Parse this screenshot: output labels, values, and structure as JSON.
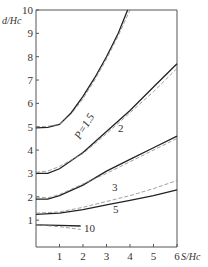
{
  "chart_data": {
    "type": "line",
    "title": "",
    "xlabel": "S/H_c",
    "ylabel": "d/H_c",
    "xlim": [
      0,
      6
    ],
    "ylim": [
      0,
      10
    ],
    "x_ticks": [
      "1",
      "2",
      "3",
      "4",
      "5",
      "6"
    ],
    "y_ticks": [
      "1",
      "2",
      "3",
      "4",
      "5",
      "6",
      "7",
      "8",
      "9",
      "10"
    ],
    "grid": false,
    "legend": "inline curve labels",
    "series": [
      {
        "name": "P=1.5",
        "style": "solid",
        "points": [
          [
            0,
            4.95
          ],
          [
            0.5,
            4.97
          ],
          [
            1,
            5.1
          ],
          [
            1.5,
            5.6
          ],
          [
            2,
            6.3
          ],
          [
            2.5,
            7.1
          ],
          [
            3,
            8.0
          ],
          [
            3.5,
            9.0
          ],
          [
            3.9,
            10.0
          ]
        ]
      },
      {
        "name": "P=1.5 (dashed)",
        "style": "dashed",
        "points": [
          [
            0,
            5.0
          ],
          [
            0.5,
            5.02
          ],
          [
            1,
            5.1
          ],
          [
            1.5,
            5.55
          ],
          [
            2,
            6.2
          ],
          [
            2.5,
            7.0
          ],
          [
            3,
            7.9
          ],
          [
            3.5,
            8.9
          ],
          [
            4.0,
            10.0
          ]
        ]
      },
      {
        "name": "2",
        "style": "solid",
        "points": [
          [
            0,
            3.0
          ],
          [
            0.5,
            3.0
          ],
          [
            1,
            3.2
          ],
          [
            2,
            3.9
          ],
          [
            3,
            4.8
          ],
          [
            4,
            5.7
          ],
          [
            5,
            6.7
          ],
          [
            6,
            7.7
          ]
        ]
      },
      {
        "name": "2 (dashed)",
        "style": "dashed",
        "points": [
          [
            0,
            3.05
          ],
          [
            0.5,
            3.1
          ],
          [
            1,
            3.3
          ],
          [
            2,
            3.85
          ],
          [
            3,
            4.7
          ],
          [
            4,
            5.6
          ],
          [
            5,
            6.5
          ],
          [
            6,
            7.5
          ]
        ]
      },
      {
        "name": "3",
        "style": "solid",
        "points": [
          [
            0,
            1.9
          ],
          [
            0.5,
            1.9
          ],
          [
            1,
            2.05
          ],
          [
            2,
            2.5
          ],
          [
            3,
            3.1
          ],
          [
            4,
            3.6
          ],
          [
            5,
            4.1
          ],
          [
            6,
            4.6
          ]
        ]
      },
      {
        "name": "3 (dashed)",
        "style": "dashed",
        "points": [
          [
            0,
            2.0
          ],
          [
            0.5,
            1.95
          ],
          [
            1,
            2.1
          ],
          [
            2,
            2.55
          ],
          [
            3,
            3.0
          ],
          [
            4,
            3.5
          ],
          [
            5,
            4.0
          ],
          [
            6,
            4.5
          ]
        ]
      },
      {
        "name": "5",
        "style": "solid",
        "points": [
          [
            0,
            1.25
          ],
          [
            1,
            1.3
          ],
          [
            2,
            1.45
          ],
          [
            3,
            1.65
          ],
          [
            4,
            1.85
          ],
          [
            5,
            2.05
          ],
          [
            6,
            2.3
          ]
        ]
      },
      {
        "name": "5 (dashed)",
        "style": "dashed",
        "points": [
          [
            0,
            1.3
          ],
          [
            1,
            1.35
          ],
          [
            2,
            1.55
          ],
          [
            3,
            1.8
          ],
          [
            4,
            2.05
          ],
          [
            5,
            2.35
          ],
          [
            6,
            2.7
          ]
        ]
      },
      {
        "name": "10",
        "style": "solid",
        "points": [
          [
            0,
            0.8
          ],
          [
            1,
            0.78
          ],
          [
            1.9,
            0.75
          ]
        ]
      },
      {
        "name": "10 (dashed)",
        "style": "dashed",
        "points": [
          [
            0,
            0.8
          ],
          [
            1,
            0.72
          ],
          [
            1.9,
            0.6
          ]
        ]
      }
    ],
    "annotations": [
      "P=1.5",
      "2",
      "3",
      "5",
      "10"
    ]
  }
}
